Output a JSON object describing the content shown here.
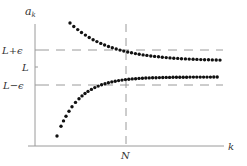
{
  "chart_data": {
    "type": "scatter",
    "title": "",
    "xlabel": "k",
    "ylabel": "a_k",
    "ytick_labels": [
      "L+ε",
      "L",
      "L−ε"
    ],
    "xtick_labels": [
      "N"
    ],
    "reference_lines": {
      "horizontal": [
        "L+ε",
        "L−ε"
      ],
      "vertical": [
        "N"
      ],
      "style": "dashed"
    },
    "series": [
      {
        "name": "upper sequence",
        "description": "decreasing, converging to L from above",
        "n_points": 40
      },
      {
        "name": "lower sequence",
        "description": "increasing, converging to L from below",
        "n_points": 45
      }
    ],
    "grid": false,
    "legend": "none"
  },
  "labels": {
    "y_axis": "a",
    "y_axis_sub": "k",
    "x_axis": "k",
    "upper_band": "L+ϵ",
    "limit": "L",
    "lower_band": "L−ϵ",
    "n_marker": "N"
  },
  "colors": {
    "axis": "#9a9a9a",
    "dots": "#111111",
    "dash": "#9a9a9a",
    "text": "#333333"
  }
}
